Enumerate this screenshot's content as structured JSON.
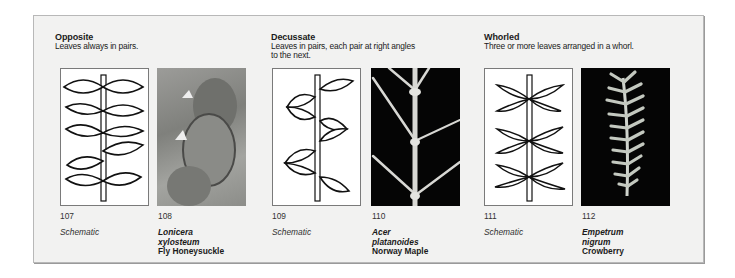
{
  "groups": [
    {
      "title": "Opposite",
      "description": [
        "Leaves always in pairs."
      ],
      "schematic": {
        "number": "107",
        "caption": "Schematic"
      },
      "photo": {
        "number": "108",
        "latin": [
          "Lonicera",
          "xylosteum"
        ],
        "common": "Fly Honeysuckle"
      }
    },
    {
      "title": "Decussate",
      "description": [
        "Leaves in pairs, each pair at right angles",
        "to the next."
      ],
      "schematic": {
        "number": "109",
        "caption": "Schematic"
      },
      "photo": {
        "number": "110",
        "latin": [
          "Acer",
          "platanoides"
        ],
        "common": "Norway Maple"
      }
    },
    {
      "title": "Whorled",
      "description": [
        "Three or more leaves arranged in a whorl."
      ],
      "schematic": {
        "number": "111",
        "caption": "Schematic"
      },
      "photo": {
        "number": "112",
        "latin": [
          "Empetrum",
          "nigrum"
        ],
        "common": "Crowberry"
      }
    }
  ],
  "colors": {
    "frame_bg": "#f2f2f1",
    "frame_border": "#b8b8b8",
    "dark_photo_bg": "#050505"
  }
}
